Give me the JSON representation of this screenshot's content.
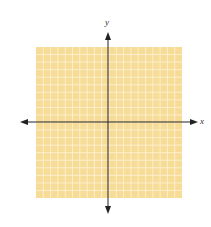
{
  "diagram": {
    "type": "coordinate-plane",
    "axes": {
      "x_label": "x",
      "y_label": "y"
    },
    "grid": {
      "cells_x": 20,
      "cells_y": 20,
      "fill_color": "#f7dc98",
      "line_color": "#fdf3d8"
    },
    "axis_color": "#222222"
  }
}
